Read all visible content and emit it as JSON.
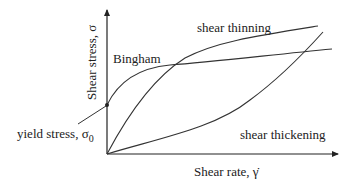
{
  "diagram": {
    "axes": {
      "y_label": "Shear stress, σ",
      "x_label": "Shear rate, γ̇",
      "x_label_main": "Shear rate, ",
      "x_label_symbol": "γ̇"
    },
    "curves": {
      "bingham": "Bingham",
      "shear_thinning": "shear thinning",
      "shear_thickening": "shear thickening"
    },
    "annotations": {
      "yield_stress_text": "yield stress, σ",
      "yield_stress_subscript": "0"
    },
    "colors": {
      "line": "#333333",
      "text": "#222222",
      "background": "#ffffff"
    }
  }
}
